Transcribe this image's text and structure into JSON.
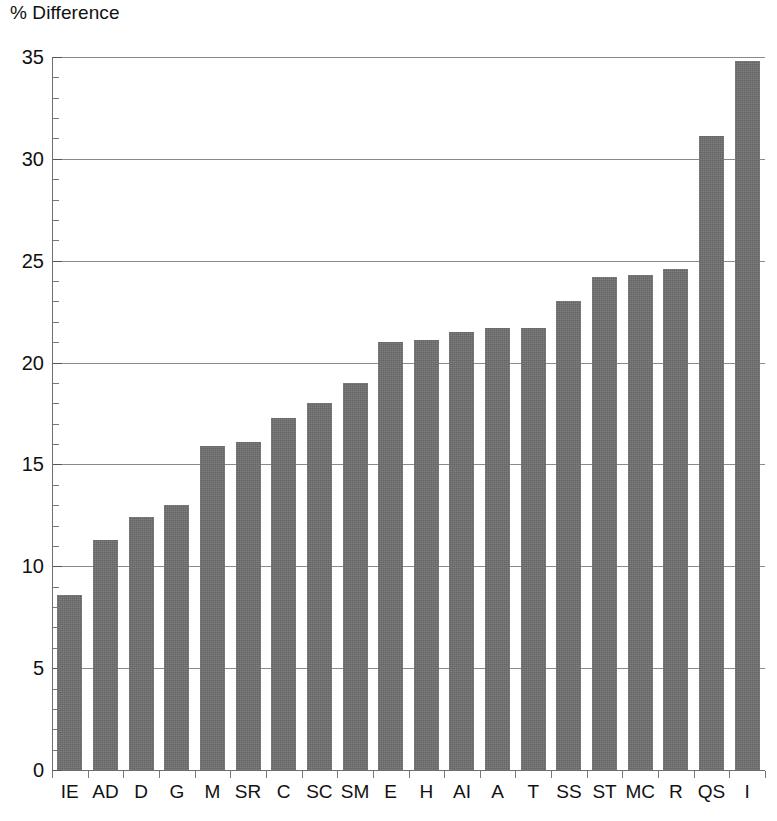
{
  "chart_data": {
    "type": "bar",
    "title": "",
    "xlabel": "",
    "ylabel": "% Difference",
    "ylim": [
      0,
      35
    ],
    "ytick_step": 5,
    "yminor_step": 1,
    "grid": true,
    "legend": null,
    "orientation": "vertical",
    "bar_color": "#6f6f6f",
    "categories": [
      "IE",
      "AD",
      "D",
      "G",
      "M",
      "SR",
      "C",
      "SC",
      "SM",
      "E",
      "H",
      "AI",
      "A",
      "T",
      "SS",
      "ST",
      "MC",
      "R",
      "QS",
      "I"
    ],
    "values": [
      8.6,
      11.3,
      12.4,
      13.0,
      15.9,
      16.1,
      17.3,
      18.0,
      19.0,
      21.0,
      21.1,
      21.5,
      21.7,
      21.7,
      23.0,
      24.2,
      24.3,
      24.6,
      31.1,
      34.8
    ],
    "ytick_labels": [
      "0",
      "5",
      "10",
      "15",
      "20",
      "25",
      "30",
      "35"
    ],
    "ytick_values": [
      0,
      5,
      10,
      15,
      20,
      25,
      30,
      35
    ]
  },
  "axis": {
    "y_title": "% Difference"
  }
}
